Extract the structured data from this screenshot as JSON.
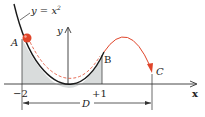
{
  "diagram": {
    "curve_label": "y = x²",
    "curve_label_base": "y = x",
    "curve_label_exp": "2",
    "y_axis_label": "y",
    "x_axis_label": "x",
    "point_labels": {
      "A": "A",
      "B": "B",
      "C": "C"
    },
    "tick_labels": {
      "left": "−2",
      "right": "+1"
    },
    "dimension_label": "D",
    "colors": {
      "curve": "#1a1a1a",
      "ball": "#e0452a",
      "trajectory": "#e0452a",
      "shading": "#d9dcdc",
      "axes": "#333333"
    }
  }
}
